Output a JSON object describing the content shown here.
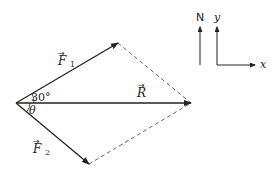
{
  "diagram": {
    "type": "vector-addition-parallelogram",
    "vectors": [
      {
        "id": "F1",
        "label": "F",
        "subscript": "1",
        "angle_label": "30°",
        "direction": "above R"
      },
      {
        "id": "F2",
        "label": "F",
        "subscript": "2",
        "angle_label": "θ",
        "direction": "below R"
      },
      {
        "id": "R",
        "label": "R",
        "subscript": ""
      }
    ],
    "angles": {
      "f1_angle": "30°",
      "f2_angle": "θ"
    },
    "compass": {
      "north_label": "N"
    },
    "axes": {
      "x_label": "x",
      "y_label": "y"
    },
    "colors": {
      "line": "#222222",
      "dashed": "#666666",
      "background": "#ffffff"
    }
  }
}
